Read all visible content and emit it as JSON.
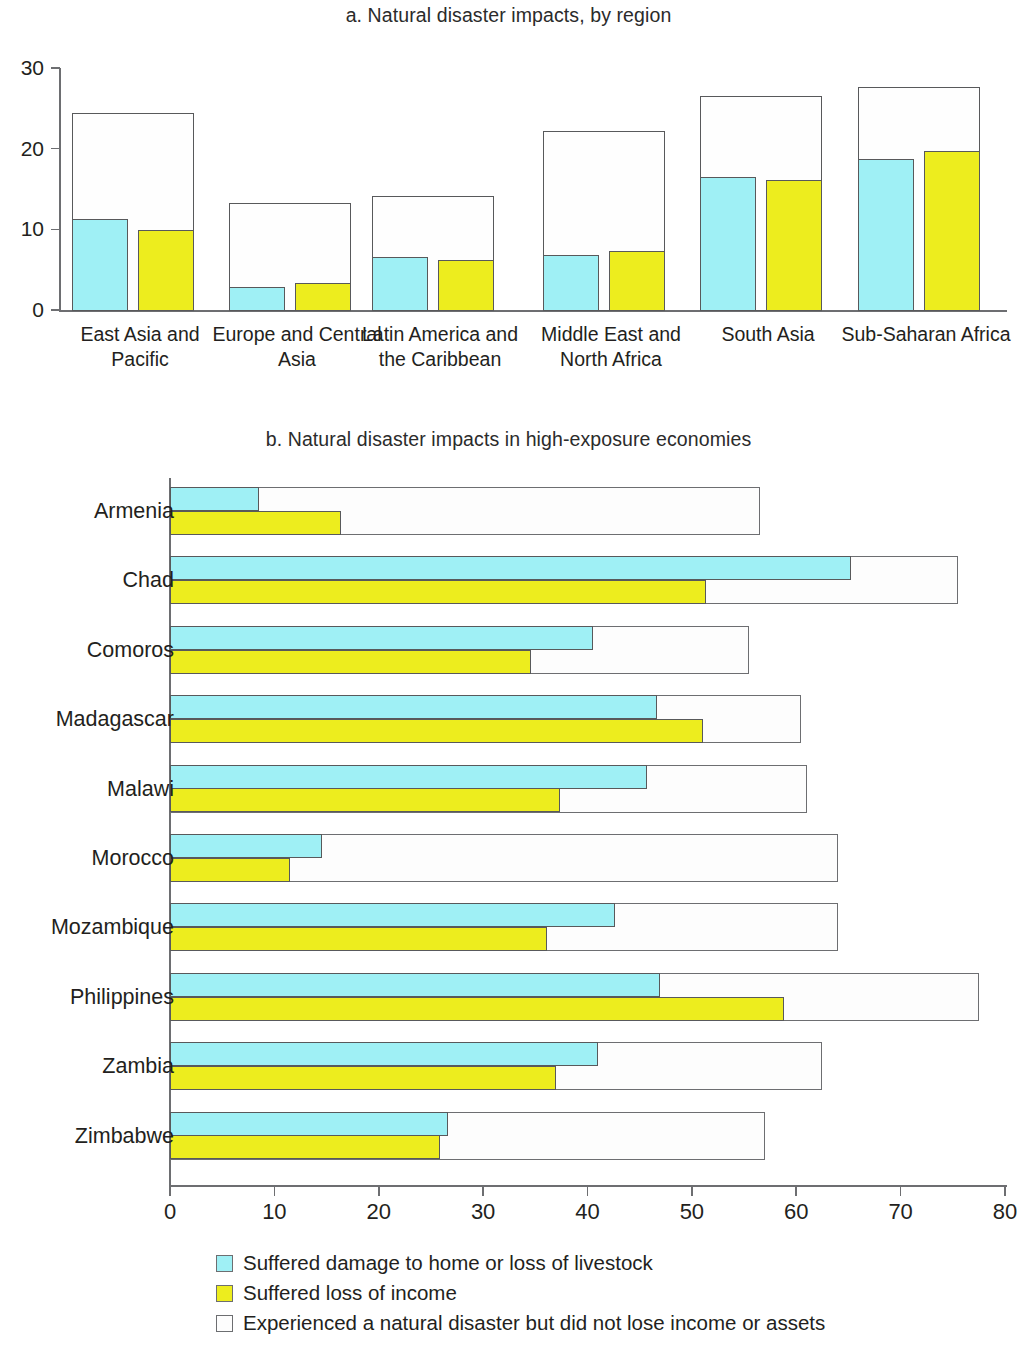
{
  "figure": {
    "panel_a_title": "a. Natural disaster impacts, by region",
    "panel_b_title": "b. Natural disaster impacts in high-exposure economies"
  },
  "colors": {
    "damage_home_livestock": "#9FF0F5",
    "loss_of_income": "#EDED1E",
    "no_loss": "#FDFDFD",
    "outline": "#6D6E71",
    "text": "#231F20"
  },
  "legend": {
    "items": [
      {
        "swatch": "#9FF0F5",
        "label": "Suffered damage to home or loss of livestock"
      },
      {
        "swatch": "#EDED1E",
        "label": "Suffered loss of income"
      },
      {
        "swatch": "#FDFDFD",
        "label": "Experienced a natural disaster but did not lose income or assets"
      }
    ]
  },
  "chart_data": [
    {
      "type": "bar",
      "id": "panel_a",
      "title": "a. Natural disaster impacts, by region",
      "orientation": "vertical",
      "xlabel": "",
      "ylabel": "",
      "ylim": [
        0,
        30
      ],
      "yticks": [
        0,
        10,
        20,
        30
      ],
      "grid": false,
      "legend_position": "bottom",
      "categories": [
        "East Asia and Pacific",
        "Europe and Central Asia",
        "Latin America and the Caribbean",
        "Middle East and North Africa",
        "South Asia",
        "Sub-Saharan Africa"
      ],
      "series": [
        {
          "name": "Experienced a natural disaster but did not lose income or assets",
          "color": "#FDFDFD",
          "values": [
            24.5,
            13.4,
            14.2,
            22.3,
            26.7,
            27.8
          ]
        },
        {
          "name": "Suffered damage to home or loss of livestock",
          "color": "#9FF0F5",
          "values": [
            11.4,
            3.0,
            6.7,
            6.9,
            16.6,
            18.9
          ]
        },
        {
          "name": "Suffered loss of income",
          "color": "#EDED1E",
          "values": [
            10.1,
            3.5,
            6.3,
            7.5,
            16.2,
            19.9
          ]
        }
      ]
    },
    {
      "type": "bar",
      "id": "panel_b",
      "title": "b. Natural disaster impacts in high-exposure economies",
      "orientation": "horizontal",
      "xlabel": "",
      "ylabel": "",
      "xlim": [
        0,
        80
      ],
      "xticks": [
        0,
        10,
        20,
        30,
        40,
        50,
        60,
        70,
        80
      ],
      "grid": false,
      "legend_position": "bottom",
      "categories": [
        "Armenia",
        "Chad",
        "Comoros",
        "Madagascar",
        "Malawi",
        "Morocco",
        "Mozambique",
        "Philippines",
        "Zambia",
        "Zimbabwe"
      ],
      "series": [
        {
          "name": "Experienced a natural disaster but did not lose income or assets",
          "color": "#FDFDFD",
          "values": [
            56.5,
            75.5,
            55.5,
            60.5,
            61.0,
            64.0,
            64.0,
            77.5,
            62.5,
            57.0
          ]
        },
        {
          "name": "Suffered damage to home or loss of livestock",
          "color": "#9FF0F5",
          "values": [
            8.5,
            65.3,
            40.5,
            46.7,
            45.7,
            14.6,
            42.6,
            47.0,
            41.0,
            26.6
          ]
        },
        {
          "name": "Suffered loss of income",
          "color": "#EDED1E",
          "values": [
            16.4,
            51.4,
            34.6,
            51.1,
            37.4,
            11.5,
            36.1,
            58.8,
            37.0,
            25.9
          ]
        }
      ]
    }
  ]
}
